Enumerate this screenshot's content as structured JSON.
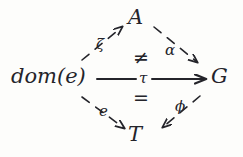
{
  "diagram": {
    "kind": "commutative-diagram",
    "background_color": "#fdfdfb",
    "ink_color": "#24242a",
    "nodes": [
      {
        "id": "A",
        "label": "A",
        "position": "top"
      },
      {
        "id": "dom_e",
        "label": "dom(e)",
        "position": "left"
      },
      {
        "id": "G",
        "label": "G",
        "position": "right"
      },
      {
        "id": "T",
        "label": "T",
        "position": "bottom"
      }
    ],
    "edges": [
      {
        "id": "zeta",
        "label": "ζ",
        "from": "dom(e)",
        "to": "A",
        "style": "dashed",
        "direction": "up-right"
      },
      {
        "id": "alpha",
        "label": "α",
        "from": "A",
        "to": "G",
        "style": "dashed",
        "direction": "down-right"
      },
      {
        "id": "e",
        "label": "e",
        "from": "dom(e)",
        "to": "T",
        "style": "dashed",
        "direction": "down-right"
      },
      {
        "id": "phi",
        "label": "ϕ",
        "from": "G",
        "to": "T",
        "style": "dashed",
        "direction": "down-left"
      },
      {
        "id": "tau",
        "label": "τ",
        "from": "dom(e)",
        "to": "G",
        "style": "solid",
        "direction": "right"
      }
    ],
    "relations": [
      {
        "id": "upper",
        "symbol": "≠",
        "meaning": "not-equal",
        "position": "above-tau"
      },
      {
        "id": "lower",
        "symbol": "=",
        "meaning": "equal",
        "position": "below-tau"
      }
    ]
  }
}
